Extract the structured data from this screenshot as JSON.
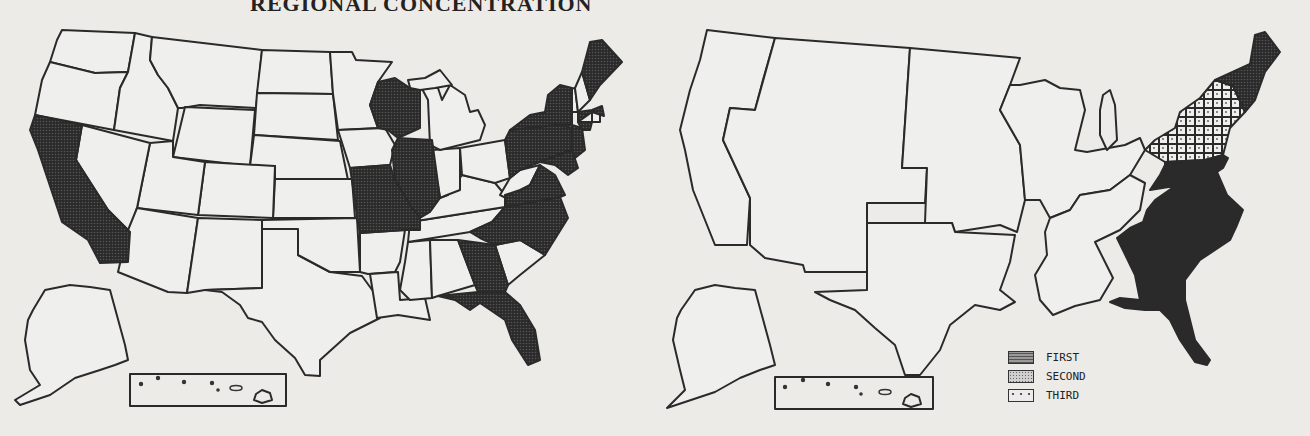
{
  "title": "REGIONAL CONCENTRATION",
  "maps": [
    {
      "id": "left",
      "description": "States shaded by concentration",
      "shaded_states": [
        "California",
        "Wisconsin",
        "Illinois",
        "Missouri",
        "Georgia",
        "Florida",
        "North Carolina",
        "Virginia",
        "Pennsylvania",
        "New York",
        "Maryland",
        "New Jersey",
        "Massachusetts",
        "Maine",
        "Connecticut"
      ],
      "shading": "second"
    },
    {
      "id": "right",
      "description": "Regions ranked first/second/third",
      "regions": [
        {
          "name": "South Atlantic",
          "rank": "FIRST"
        },
        {
          "name": "New England",
          "rank": "SECOND"
        },
        {
          "name": "Middle Atlantic",
          "rank": "THIRD"
        }
      ]
    }
  ],
  "legend": {
    "items": [
      {
        "label": "FIRST",
        "pattern": "dense-hatch"
      },
      {
        "label": "SECOND",
        "pattern": "fine-dot"
      },
      {
        "label": "THIRD",
        "pattern": "sparse-dot"
      }
    ]
  },
  "colors": {
    "background": "#ecebe8",
    "outline": "#2a2a2a",
    "first": "#8a8a8a",
    "second": "#cfcfcf",
    "third": "#ececec"
  }
}
